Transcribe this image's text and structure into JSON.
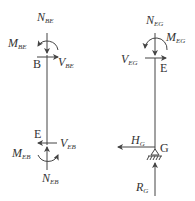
{
  "diagram": {
    "left_member": {
      "top_node": "B",
      "bottom_node": "E",
      "forces": {
        "N_BE": {
          "main": "N",
          "sub": "BE"
        },
        "M_BE": {
          "main": "M",
          "sub": "BE"
        },
        "V_BE": {
          "main": "V",
          "sub": "BE"
        },
        "V_EB": {
          "main": "V",
          "sub": "EB"
        },
        "M_EB": {
          "main": "M",
          "sub": "EB"
        },
        "N_EB": {
          "main": "N",
          "sub": "EB"
        }
      }
    },
    "right_member": {
      "top_node": "E",
      "bottom_node": "G",
      "forces": {
        "N_EG": {
          "main": "N",
          "sub": "EG"
        },
        "M_EG": {
          "main": "M",
          "sub": "EG"
        },
        "V_EG": {
          "main": "V",
          "sub": "EG"
        },
        "H_G": {
          "main": "H",
          "sub": "G"
        },
        "R_G": {
          "main": "R",
          "sub": "G"
        }
      },
      "support": "pin-support"
    },
    "colors": {
      "line": "#444444",
      "text": "#333333"
    }
  }
}
